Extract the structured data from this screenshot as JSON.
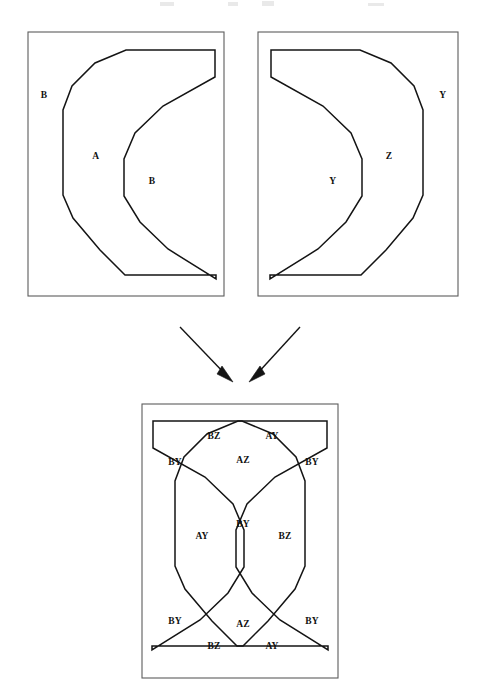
{
  "figure": {
    "title": "",
    "background_color": "#ffffff",
    "ink_color": "#141414",
    "panel_border_color": "#5c5c5c",
    "panels": [
      {
        "id": "panel-left",
        "name": "left-source-panel",
        "x": 28,
        "y": 32,
        "width": 196,
        "height": 264,
        "labels": [
          {
            "id": "left-outer",
            "text": "B",
            "x": 44,
            "y": 96
          },
          {
            "id": "left-ring",
            "text": "A",
            "x": 96,
            "y": 157
          },
          {
            "id": "left-inner",
            "text": "B",
            "x": 152,
            "y": 182
          }
        ]
      },
      {
        "id": "panel-right",
        "name": "right-source-panel",
        "x": 258,
        "y": 32,
        "width": 200,
        "height": 264,
        "labels": [
          {
            "id": "right-outer",
            "text": "Y",
            "x": 443,
            "y": 96
          },
          {
            "id": "right-ring",
            "text": "Z",
            "x": 389,
            "y": 157
          },
          {
            "id": "right-inner",
            "text": "Y",
            "x": 333,
            "y": 182
          }
        ]
      },
      {
        "id": "panel-bottom",
        "name": "combined-overlay-panel",
        "x": 142,
        "y": 404,
        "width": 196,
        "height": 274,
        "labels": [
          {
            "id": "ov-top-bz",
            "text": "BZ",
            "x": 214,
            "y": 437
          },
          {
            "id": "ov-top-ay",
            "text": "AY",
            "x": 272,
            "y": 437
          },
          {
            "id": "ov-top-az",
            "text": "AZ",
            "x": 243,
            "y": 461
          },
          {
            "id": "ov-topleft-by",
            "text": "BY",
            "x": 175,
            "y": 463
          },
          {
            "id": "ov-topright-by",
            "text": "BY",
            "x": 312,
            "y": 463
          },
          {
            "id": "ov-mid-ay",
            "text": "AY",
            "x": 202,
            "y": 537
          },
          {
            "id": "ov-mid-by",
            "text": "BY",
            "x": 243,
            "y": 525
          },
          {
            "id": "ov-mid-bz",
            "text": "BZ",
            "x": 285,
            "y": 537
          },
          {
            "id": "ov-botleft-by",
            "text": "BY",
            "x": 175,
            "y": 622
          },
          {
            "id": "ov-botright-by",
            "text": "BY",
            "x": 312,
            "y": 622
          },
          {
            "id": "ov-bot-az",
            "text": "AZ",
            "x": 243,
            "y": 625
          },
          {
            "id": "ov-bot-bz",
            "text": "BZ",
            "x": 214,
            "y": 647
          },
          {
            "id": "ov-bot-ay",
            "text": "AY",
            "x": 272,
            "y": 647
          }
        ]
      }
    ],
    "shapes": {
      "left_outer_crescent": "M 215,50 L 126,50 L 95,63 L 72,86 L 63,110 L 63,195 L 73,218 L 100,250 L 125,275 L 216,275 L 216,279 L 168,249 L 140,222 L 124,196 L 124,159 L 135,133 L 163,106 L 215,77 Z",
      "right_outer_crescent": "M 271,50 L 360,50 L 391,63 L 414,86 L 423,110 L 423,195 L 413,218 L 386,250 L 361,275 L 270,275 L 270,279 L 318,249 L 346,222 L 362,196 L 362,159 L 351,133 L 323,106 L 271,77 Z",
      "overlay_crescent_a": "M 327,421 L 238,421 L 207,434 L 184,457 L 175,481 L 175,566 L 185,589 L 212,621 L 237,646 L 328,646 L 328,650 L 280,620 L 252,593 L 236,567 L 236,530 L 247,504 L 275,477 L 327,448 Z",
      "overlay_crescent_z": "M 153,421 L 242,421 L 273,434 L 296,457 L 305,481 L 305,566 L 295,589 L 268,621 L 243,646 L 152,646 L 152,650 L 200,620 L 228,593 L 244,567 L 244,530 L 233,504 L 205,477 L 153,448 Z"
    },
    "arrows": [
      {
        "id": "arrow-left",
        "name": "arrow-left-to-combined",
        "from_x": 180,
        "from_y": 327,
        "to_x": 232,
        "to_y": 381
      },
      {
        "id": "arrow-right",
        "name": "arrow-right-to-combined",
        "from_x": 300,
        "from_y": 327,
        "to_x": 250,
        "to_y": 381
      }
    ]
  }
}
